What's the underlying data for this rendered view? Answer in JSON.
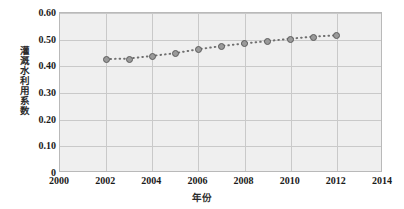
{
  "chart_data": {
    "type": "scatter",
    "title": "",
    "xlabel": "年份",
    "ylabel": "灌溉水利用系数",
    "x": [
      2002,
      2003,
      2004,
      2005,
      2006,
      2007,
      2008,
      2009,
      2010,
      2011,
      2012
    ],
    "values": [
      0.425,
      0.427,
      0.437,
      0.447,
      0.462,
      0.474,
      0.484,
      0.493,
      0.502,
      0.51,
      0.515
    ],
    "series": [
      {
        "name": "灌溉水利用系数",
        "values": [
          0.425,
          0.427,
          0.437,
          0.447,
          0.462,
          0.474,
          0.484,
          0.493,
          0.502,
          0.51,
          0.515
        ]
      }
    ],
    "xlim": [
      2000,
      2014
    ],
    "ylim": [
      0,
      0.6
    ],
    "xticks": [
      "2000",
      "2002",
      "2004",
      "2006",
      "2008",
      "2010",
      "2012",
      "2014"
    ],
    "xtick_values": [
      2000,
      2002,
      2004,
      2006,
      2008,
      2010,
      2012,
      2014
    ],
    "yticks": [
      "0",
      "0.10",
      "0.20",
      "0.30",
      "0.40",
      "0.50",
      "0.60"
    ],
    "ytick_values": [
      0,
      0.1,
      0.2,
      0.3,
      0.4,
      0.5,
      0.6
    ],
    "grid": true,
    "legend": "none",
    "marker": "circle",
    "line_style": "dotted",
    "colors": {
      "marker_fill": "#9a9a9a",
      "marker_edge": "#5d5d5d",
      "line": "#6f6f6f",
      "plot_background": "#efefef",
      "gridline": "#c9c9c9",
      "plot_border": "#b9b9b9",
      "page_background": "#ffffff",
      "tick_label": "#1a1a1a",
      "axis_title": "#2b2b2b"
    }
  }
}
